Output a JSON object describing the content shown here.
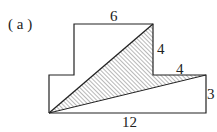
{
  "figure_label": "( a )",
  "labels": {
    "top": "6",
    "right_upper": "4",
    "step": "4",
    "right_lower": "3",
    "bottom": "12"
  },
  "colors": {
    "stroke": "#222222",
    "hatch": "#333333",
    "background": "#ffffff"
  }
}
